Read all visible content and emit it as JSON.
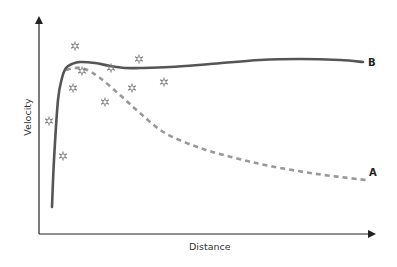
{
  "chart_data": {
    "type": "line",
    "title": "",
    "xlabel": "Distance",
    "ylabel": "Velocity",
    "grid": false,
    "axis_ticks": false,
    "legend": "inline end-of-line labels",
    "series": [
      {
        "name": "B",
        "style": "solid",
        "color": "#555555",
        "points_px": [
          [
            52,
            207
          ],
          [
            54,
            160
          ],
          [
            58,
            100
          ],
          [
            62,
            78
          ],
          [
            66,
            68
          ],
          [
            72,
            64
          ],
          [
            80,
            62
          ],
          [
            95,
            63
          ],
          [
            110,
            66
          ],
          [
            125,
            68
          ],
          [
            140,
            68
          ],
          [
            170,
            67
          ],
          [
            210,
            64
          ],
          [
            260,
            60
          ],
          [
            300,
            59
          ],
          [
            340,
            60
          ],
          [
            363,
            62
          ]
        ]
      },
      {
        "name": "A",
        "style": "dashed",
        "color": "#999999",
        "points_px": [
          [
            66,
            70
          ],
          [
            75,
            68
          ],
          [
            85,
            69
          ],
          [
            100,
            78
          ],
          [
            120,
            95
          ],
          [
            140,
            113
          ],
          [
            165,
            133
          ],
          [
            200,
            148
          ],
          [
            235,
            158
          ],
          [
            270,
            166
          ],
          [
            310,
            173
          ],
          [
            340,
            177
          ],
          [
            366,
            180
          ]
        ]
      }
    ],
    "scatter": {
      "name": "observations",
      "marker": "star",
      "color": "#777777",
      "points_px": [
        [
          75,
          46
        ],
        [
          139,
          59
        ],
        [
          82,
          71
        ],
        [
          111,
          68
        ],
        [
          73,
          88
        ],
        [
          132,
          88
        ],
        [
          164,
          82
        ],
        [
          105,
          102
        ],
        [
          49,
          121
        ],
        [
          63,
          156
        ]
      ]
    },
    "axes_px": {
      "origin": [
        39,
        234
      ],
      "x_end": [
        376,
        234
      ],
      "y_end": [
        39,
        16
      ]
    }
  },
  "labels": {
    "xlabel": "Distance",
    "ylabel": "Velocity",
    "seriesA": "A",
    "seriesB": "B"
  }
}
